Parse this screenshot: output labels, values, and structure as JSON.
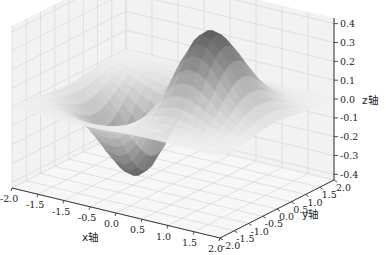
{
  "chart_data": {
    "type": "surface3d",
    "title": "",
    "function_hint": "z = x * exp(-x^2 - y^2)",
    "colormap": "gray",
    "xlabel": "x轴",
    "ylabel": "y轴",
    "zlabel": "z轴",
    "x_ticks": [
      "-2.0",
      "-1.5",
      "-1.5",
      "-0.5",
      "0.0",
      "0.5",
      "1.0",
      "1.5",
      "2.0"
    ],
    "y_ticks": [
      "-2.0",
      "-1.5",
      "-1.0",
      "-0.5",
      "0.0",
      "0.5",
      "1.0",
      "1.5",
      "2.0"
    ],
    "z_ticks": [
      "-0.4",
      "-0.3",
      "-0.2",
      "-0.1",
      "0.0",
      "0.1",
      "0.2",
      "0.3",
      "0.4"
    ],
    "xlim": [
      -2,
      2
    ],
    "ylim": [
      -2,
      2
    ],
    "zlim": [
      -0.43,
      0.43
    ],
    "grid": true,
    "peak": {
      "x": 0.707,
      "y": 0,
      "z": 0.429
    },
    "trough": {
      "x": -0.707,
      "y": 0,
      "z": -0.429
    }
  }
}
